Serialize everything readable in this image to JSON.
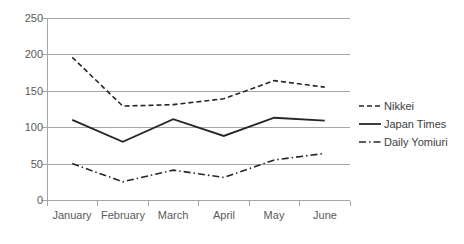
{
  "chart_data": {
    "type": "line",
    "title": "",
    "xlabel": "",
    "ylabel": "",
    "categories": [
      "January",
      "February",
      "March",
      "April",
      "May",
      "June"
    ],
    "ylim": [
      0,
      250
    ],
    "yticks": [
      0,
      50,
      100,
      150,
      200,
      250
    ],
    "grid": true,
    "legend_position": "right",
    "series": [
      {
        "name": "Nikkei",
        "style": "dashed",
        "color": "#262626",
        "values": [
          196,
          129,
          131,
          139,
          164,
          155
        ]
      },
      {
        "name": "Japan Times",
        "style": "solid",
        "color": "#262626",
        "values": [
          110,
          80,
          111,
          88,
          113,
          109
        ]
      },
      {
        "name": "Daily Yomiuri",
        "style": "dash-dot",
        "color": "#262626",
        "values": [
          50,
          25,
          41,
          31,
          55,
          64
        ]
      }
    ]
  },
  "axis": {
    "y_tick_labels": [
      "250",
      "200",
      "150",
      "100",
      "50",
      "0"
    ],
    "x_tick_labels": [
      "January",
      "February",
      "March",
      "April",
      "May",
      "June"
    ]
  },
  "legend": {
    "entries": [
      {
        "label": "Nikkei",
        "swatch": "dashed-line-swatch"
      },
      {
        "label": "Japan Times",
        "swatch": "solid-line-swatch"
      },
      {
        "label": "Daily Yomiuri",
        "swatch": "dash-dot-line-swatch"
      }
    ]
  }
}
